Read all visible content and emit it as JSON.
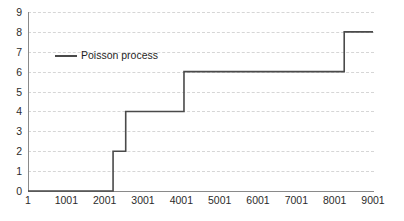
{
  "chart_data": {
    "type": "line",
    "subtype": "step",
    "title": "",
    "xlabel": "",
    "ylabel": "",
    "xlim": [
      1,
      9001
    ],
    "ylim": [
      0,
      9
    ],
    "grid": true,
    "legend_position": "inside-top-left",
    "x_ticks": [
      1,
      1001,
      2001,
      3001,
      4001,
      5001,
      6001,
      7001,
      8001,
      9001
    ],
    "x_tick_labels": [
      "1",
      "1001",
      "2001",
      "3001",
      "4001",
      "5001",
      "6001",
      "7001",
      "8001",
      "9001"
    ],
    "y_ticks": [
      0,
      1,
      2,
      3,
      4,
      5,
      6,
      7,
      8,
      9
    ],
    "y_tick_labels": [
      "0",
      "1",
      "2",
      "3",
      "4",
      "5",
      "6",
      "7",
      "8",
      "9"
    ],
    "series": [
      {
        "name": "Poisson process",
        "color": "#4a4a4a",
        "steps": [
          {
            "x": 1,
            "y": 0
          },
          {
            "x": 2220,
            "y": 2
          },
          {
            "x": 2550,
            "y": 4
          },
          {
            "x": 4070,
            "y": 6
          },
          {
            "x": 8250,
            "y": 8
          },
          {
            "x": 9001,
            "y": 8
          }
        ]
      }
    ]
  },
  "legend": {
    "entries": [
      {
        "label": "Poisson process"
      }
    ]
  },
  "caption": {
    "text": ""
  },
  "colors": {
    "series": "#4a4a4a",
    "grid": "#d6d6d6",
    "axis": "#8a8a8a",
    "text": "#2b2b2b",
    "background": "#ffffff"
  }
}
